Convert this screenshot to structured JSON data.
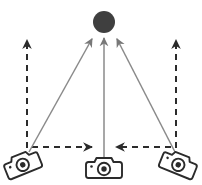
{
  "diagram": {
    "title": "Three-camera convergence on a target",
    "background_color": "#ffffff",
    "width": 202,
    "height": 185,
    "target": {
      "label": "target-object",
      "shape": "circle",
      "cx": 104,
      "cy": 22,
      "r": 11,
      "fill": "#3f3f3f"
    },
    "cameras": [
      {
        "id": "camera-left",
        "label": "left-camera",
        "x": 22,
        "y": 163,
        "rotation_deg": -22,
        "scale": 1.0,
        "stroke": "#2b2b2b"
      },
      {
        "id": "camera-center",
        "label": "center-camera",
        "x": 104,
        "y": 167,
        "rotation_deg": 0,
        "scale": 1.0,
        "stroke": "#2b2b2b"
      },
      {
        "id": "camera-right",
        "label": "right-camera",
        "x": 179,
        "y": 163,
        "rotation_deg": 22,
        "scale": 1.0,
        "stroke": "#2b2b2b"
      }
    ],
    "sight_lines": [
      {
        "id": "sight-line-left",
        "label": "left-camera-sight-line",
        "x1": 29,
        "y1": 152,
        "x2": 93,
        "y2": 37,
        "color": "#8a8a8a",
        "width": 1.5,
        "style": "solid",
        "arrow": "end"
      },
      {
        "id": "sight-line-center",
        "label": "center-camera-sight-line",
        "x1": 104,
        "y1": 158,
        "x2": 104,
        "y2": 36,
        "color": "#8a8a8a",
        "width": 1.5,
        "style": "solid",
        "arrow": "end"
      },
      {
        "id": "sight-line-right",
        "label": "right-camera-sight-line",
        "x1": 175,
        "y1": 152,
        "x2": 116,
        "y2": 37,
        "color": "#8a8a8a",
        "width": 1.5,
        "style": "solid",
        "arrow": "end"
      }
    ],
    "motion_arrows": [
      {
        "id": "motion-left-up",
        "label": "left-camera-up-motion",
        "x1": 27,
        "y1": 148,
        "x2": 27,
        "y2": 40,
        "color": "#2b2b2b",
        "width": 2,
        "style": "dashed",
        "dash": "6 5",
        "direction": "up"
      },
      {
        "id": "motion-left-right",
        "label": "left-camera-right-motion",
        "x1": 32,
        "y1": 147,
        "x2": 92,
        "y2": 147,
        "color": "#2b2b2b",
        "width": 2,
        "style": "dashed",
        "dash": "6 5",
        "direction": "right"
      },
      {
        "id": "motion-right-up",
        "label": "right-camera-up-motion",
        "x1": 176,
        "y1": 148,
        "x2": 176,
        "y2": 40,
        "color": "#2b2b2b",
        "width": 2,
        "style": "dashed",
        "dash": "6 5",
        "direction": "up"
      },
      {
        "id": "motion-right-left",
        "label": "right-camera-left-motion",
        "x1": 171,
        "y1": 147,
        "x2": 116,
        "y2": 147,
        "color": "#2b2b2b",
        "width": 2,
        "style": "dashed",
        "dash": "6 5",
        "direction": "left"
      }
    ],
    "legend": {
      "solid_line_meaning": "line of sight to target",
      "dashed_line_meaning": "camera motion direction"
    }
  }
}
